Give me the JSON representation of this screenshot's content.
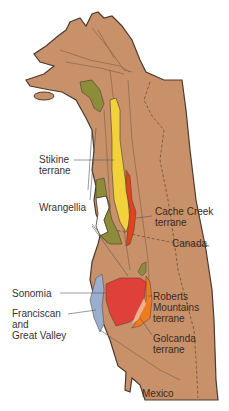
{
  "colors": {
    "land": "#c8916a",
    "outline": "#4a3a30",
    "inner_line": "#8a6448",
    "stikine": "#f2d23a",
    "wrangellia": "#8c8c3a",
    "cache_creek": "#e0441e",
    "sonomia": "#e0403a",
    "roberts": "#f07a20",
    "golconda": "#f0b090",
    "franciscan": "#9aaed0",
    "background": "#ffffff"
  },
  "labels": {
    "stikine": "Stikine\nterrane",
    "wrangellia": "Wrangellia",
    "cache_creek": "Cache Creek\nterrane",
    "canada": "Canada",
    "sonomia": "Sonomia",
    "franciscan": "Franciscan\nand\nGreat Valley",
    "roberts": "Roberts\nMountains\nterrane",
    "golcanda": "Golcanda\nterrane",
    "mexico": "Mexico"
  }
}
